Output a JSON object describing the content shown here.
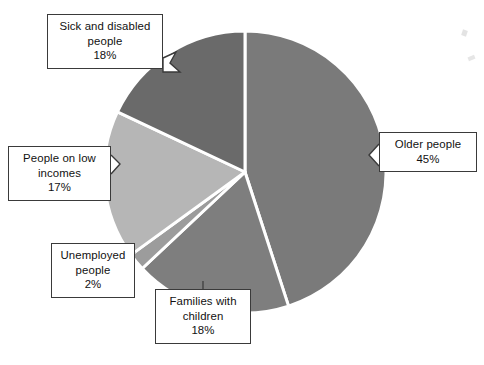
{
  "figure": {
    "background_color": "#ffffff",
    "outline_color": "#3a3a3a",
    "separator_color": "#ffffff"
  },
  "chart_data": {
    "type": "pie",
    "title": "",
    "subtitle": "",
    "xlabel": "",
    "ylabel": "",
    "legend_position": "none",
    "grid": false,
    "units": "percent",
    "start_angle_deg": 0,
    "direction": "clockwise",
    "center": {
      "x": 245,
      "y": 172
    },
    "radius": 141,
    "categories": [
      "Older people",
      "Families with children",
      "Unemployed people",
      "People on low incomes",
      "Sick and disabled people"
    ],
    "values": [
      45,
      18,
      2,
      17,
      18
    ],
    "total": 100,
    "slices": [
      {
        "label": "Older people",
        "value": 45,
        "value_text": "45%",
        "color": "#7a7a7a",
        "start_deg": 0,
        "end_deg": 162,
        "label_lines": [
          "Older people",
          "45%"
        ]
      },
      {
        "label": "Families with children",
        "value": 18,
        "value_text": "18%",
        "color": "#7e7e7e",
        "start_deg": 162,
        "end_deg": 226.8,
        "label_lines": [
          "Families with",
          "children",
          "18%"
        ]
      },
      {
        "label": "Unemployed people",
        "value": 2,
        "value_text": "2%",
        "color": "#9c9c9c",
        "start_deg": 226.8,
        "end_deg": 234,
        "label_lines": [
          "Unemployed",
          "people",
          "2%"
        ]
      },
      {
        "label": "People on low incomes",
        "value": 17,
        "value_text": "17%",
        "color": "#b6b6b6",
        "start_deg": 234,
        "end_deg": 295.2,
        "label_lines": [
          "People on low",
          "incomes",
          "17%"
        ]
      },
      {
        "label": "Sick and disabled people",
        "value": 18,
        "value_text": "18%",
        "color": "#6a6a6a",
        "start_deg": 295.2,
        "end_deg": 360,
        "label_lines": [
          "Sick and disabled",
          "people",
          "18%"
        ]
      }
    ]
  },
  "callouts": {
    "sick": {
      "line1": "Sick and disabled",
      "line2": "people",
      "line3": "18%"
    },
    "older": {
      "line1": "Older people",
      "line2": "45%"
    },
    "low_incomes": {
      "line1": "People on low",
      "line2": "incomes",
      "line3": "17%"
    },
    "unemployed": {
      "line1": "Unemployed",
      "line2": "people",
      "line3": "2%"
    },
    "families": {
      "line1": "Families with",
      "line2": "children",
      "line3": "18%"
    }
  }
}
